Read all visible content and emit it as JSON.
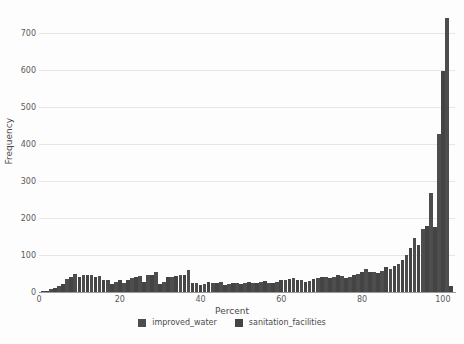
{
  "chart_data": {
    "type": "bar",
    "title": "",
    "subtitle": "",
    "xlabel": "Percent",
    "ylabel": "Frequency",
    "xlim": [
      0,
      103
    ],
    "ylim": [
      0,
      760
    ],
    "grid": true,
    "grid_axis": "y",
    "legend_position": "bottom",
    "xticks": [
      0,
      20,
      40,
      60,
      80,
      100
    ],
    "xtick_labels": [
      "0",
      "20",
      "40",
      "60",
      "80",
      "100"
    ],
    "yticks": [
      0,
      100,
      200,
      300,
      400,
      500,
      600,
      700
    ],
    "ytick_labels": [
      "0",
      "100",
      "200",
      "300",
      "400",
      "500",
      "600",
      "700"
    ],
    "bin_width": 1.0,
    "series": [
      {
        "name": "improved_water",
        "color": "#4d4d4d",
        "x": [
          1,
          3,
          5,
          7,
          9,
          11,
          13,
          15,
          17,
          19,
          21,
          23,
          25,
          27,
          29,
          31,
          33,
          35,
          37,
          39,
          41,
          43,
          45,
          47,
          49,
          51,
          53,
          55,
          57,
          59,
          61,
          63,
          65,
          67,
          69,
          71,
          73,
          75,
          77,
          79,
          81,
          83,
          85,
          87,
          89,
          91,
          93,
          95,
          97,
          99,
          101
        ],
        "values": [
          5,
          11,
          20,
          38,
          52,
          48,
          50,
          46,
          34,
          30,
          28,
          40,
          46,
          48,
          58,
          30,
          44,
          48,
          62,
          26,
          24,
          28,
          30,
          24,
          28,
          26,
          28,
          30,
          26,
          30,
          34,
          40,
          36,
          32,
          40,
          44,
          44,
          46,
          42,
          52,
          64,
          56,
          60,
          66,
          78,
          104,
          148,
          174,
          270,
          430,
          745
        ]
      },
      {
        "name": "sanitation_facilities",
        "color": "#444444",
        "x": [
          2,
          4,
          6,
          8,
          10,
          12,
          14,
          16,
          18,
          20,
          22,
          24,
          26,
          28,
          30,
          32,
          34,
          36,
          38,
          40,
          42,
          44,
          46,
          48,
          50,
          52,
          54,
          56,
          58,
          60,
          62,
          64,
          66,
          68,
          70,
          72,
          74,
          76,
          78,
          80,
          82,
          84,
          86,
          88,
          90,
          92,
          94,
          96,
          98,
          100,
          102
        ],
        "values": [
          6,
          14,
          24,
          44,
          44,
          48,
          44,
          36,
          24,
          34,
          36,
          44,
          30,
          50,
          24,
          42,
          46,
          50,
          28,
          22,
          30,
          26,
          22,
          26,
          24,
          30,
          26,
          32,
          28,
          36,
          38,
          34,
          30,
          38,
          42,
          40,
          48,
          40,
          48,
          58,
          58,
          54,
          70,
          72,
          90,
          122,
          130,
          180,
          178,
          600,
          20
        ]
      }
    ]
  },
  "legend": {
    "items": [
      {
        "label": "improved_water",
        "color": "#4d4d4d"
      },
      {
        "label": "sanitation_facilities",
        "color": "#444444"
      }
    ]
  }
}
